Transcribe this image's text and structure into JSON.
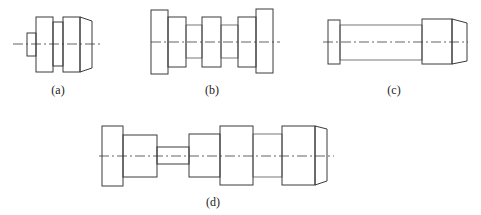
{
  "figure": {
    "subfigures": [
      {
        "id": "a",
        "label": "(a)",
        "description": "Short stepped shaft with small left end, two large shoulders with narrow neck, chamfered right end"
      },
      {
        "id": "b",
        "label": "(b)",
        "description": "Symmetric shaft: large end flanges, two medium blocks, center block, two narrow necks"
      },
      {
        "id": "c",
        "label": "(c)",
        "description": "Long slender shaft with left flange, right large block and chamfered end"
      },
      {
        "id": "d",
        "label": "(d)",
        "description": "Long multi-step shaft: flange, block, thin neck, block, large shoulder, neck, large block with chamfered end"
      }
    ]
  },
  "colors": {
    "line": "#3a3a3a",
    "background": "#ffffff"
  }
}
